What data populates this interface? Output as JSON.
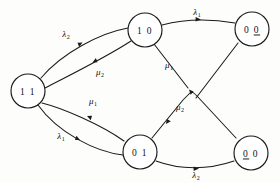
{
  "diagram": {
    "type": "state-transition-diagram",
    "title": "",
    "nodes": [
      {
        "id": "s11",
        "label": "1 1",
        "digits": [
          "1",
          "1"
        ],
        "underline_index": -1,
        "cx": 28,
        "cy": 91,
        "r": 17
      },
      {
        "id": "s10",
        "label": "1 0",
        "digits": [
          "1",
          "0"
        ],
        "underline_index": -1,
        "cx": 145,
        "cy": 30,
        "r": 17
      },
      {
        "id": "s01",
        "label": "0 1",
        "digits": [
          "0",
          "1"
        ],
        "underline_index": -1,
        "cx": 140,
        "cy": 152,
        "r": 17
      },
      {
        "id": "s00a",
        "label": "0 0",
        "digits": [
          "0",
          "0"
        ],
        "underline_index": 1,
        "cx": 252,
        "cy": 29,
        "r": 17
      },
      {
        "id": "s00b",
        "label": "0 0",
        "digits": [
          "0",
          "0"
        ],
        "underline_index": 0,
        "cx": 251,
        "cy": 153,
        "r": 17
      }
    ],
    "edges": [
      {
        "id": "e1",
        "from": "s11",
        "to": "s10",
        "label": "λ",
        "subscript": "2",
        "label_x": 66,
        "label_y": 34,
        "greek": "lambda"
      },
      {
        "id": "e2",
        "from": "s10",
        "to": "s11",
        "label": "μ",
        "subscript": "2",
        "label_x": 100,
        "label_y": 72,
        "greek": "mu"
      },
      {
        "id": "e3",
        "from": "s11",
        "to": "s01",
        "label": "λ",
        "subscript": "1",
        "label_x": 61,
        "label_y": 136,
        "greek": "lambda"
      },
      {
        "id": "e4",
        "from": "s01",
        "to": "s11",
        "label": "μ",
        "subscript": "1",
        "label_x": 93,
        "label_y": 101,
        "greek": "mu"
      },
      {
        "id": "e5",
        "from": "s10",
        "to": "s00a",
        "label": "λ",
        "subscript": "1",
        "label_x": 197,
        "label_y": 12,
        "greek": "lambda"
      },
      {
        "id": "e6",
        "from": "s00a",
        "to": "s01",
        "label": "μ",
        "subscript": "1",
        "label_x": 169,
        "label_y": 65,
        "greek": "mu"
      },
      {
        "id": "e7",
        "from": "s00b",
        "to": "s10",
        "label": "μ",
        "subscript": "2",
        "label_x": 180,
        "label_y": 107,
        "greek": "mu"
      },
      {
        "id": "e8",
        "from": "s01",
        "to": "s00b",
        "label": "λ",
        "subscript": "2",
        "label_x": 196,
        "label_y": 175,
        "greek": "lambda"
      }
    ],
    "colors": {
      "stroke": "#1a1a1a",
      "node_fill": "#ffffff",
      "background": "#fdfdfc",
      "text": "#111111"
    }
  }
}
